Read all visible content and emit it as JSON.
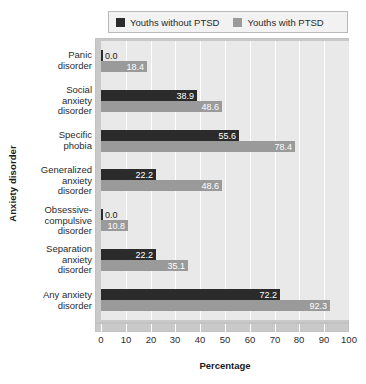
{
  "chart_data": {
    "type": "bar",
    "orientation": "horizontal",
    "title": "",
    "xlabel": "Percentage",
    "ylabel": "Anxiety disorder",
    "xlim": [
      0,
      100
    ],
    "xticks": [
      0,
      10,
      20,
      30,
      40,
      50,
      60,
      70,
      80,
      90,
      100
    ],
    "grid": true,
    "grid_axis": "x",
    "legend_position": "top",
    "categories": [
      "Panic disorder",
      "Social anxiety disorder",
      "Specific phobia",
      "Generalized anxiety disorder",
      "Obsessive-compulsive disorder",
      "Separation anxiety disorder",
      "Any anxiety disorder"
    ],
    "category_lines": [
      [
        "Panic",
        "disorder"
      ],
      [
        "Social",
        "anxiety",
        "disorder"
      ],
      [
        "Specific",
        "phobia"
      ],
      [
        "Generalized",
        "anxiety",
        "disorder"
      ],
      [
        "Obsessive-",
        "compulsive",
        "disorder"
      ],
      [
        "Separation",
        "anxiety",
        "disorder"
      ],
      [
        "Any anxiety",
        "disorder"
      ]
    ],
    "series": [
      {
        "name": "Youths without PTSD",
        "color": "#2b2b2b",
        "values": [
          0.0,
          38.9,
          55.6,
          22.2,
          0.0,
          22.2,
          72.2
        ],
        "labels": [
          "0.0",
          "38.9",
          "55.6",
          "22.2",
          "0.0",
          "22.2",
          "72.2"
        ]
      },
      {
        "name": "Youths with PTSD",
        "color": "#9a9a9a",
        "values": [
          18.4,
          48.6,
          78.4,
          48.6,
          10.8,
          35.1,
          92.3
        ],
        "labels": [
          "18.4",
          "48.6",
          "78.4",
          "48.6",
          "10.8",
          "35.1",
          "92.3"
        ]
      }
    ]
  },
  "legend": {
    "items": [
      {
        "label": "Youths without PTSD",
        "color": "#2b2b2b"
      },
      {
        "label": "Youths with PTSD",
        "color": "#9a9a9a"
      }
    ]
  },
  "axes": {
    "x_title": "Percentage",
    "y_title": "Anxiety disorder",
    "x_tick_labels": [
      "0",
      "10",
      "20",
      "30",
      "40",
      "50",
      "60",
      "70",
      "80",
      "90",
      "100"
    ]
  },
  "colors": {
    "plot_background": "#e9e9e9",
    "frame": "#c9c9c9",
    "gridline": "#ffffff",
    "series_dark": "#2b2b2b",
    "series_gray": "#9a9a9a",
    "text": "#2b2b2b"
  }
}
